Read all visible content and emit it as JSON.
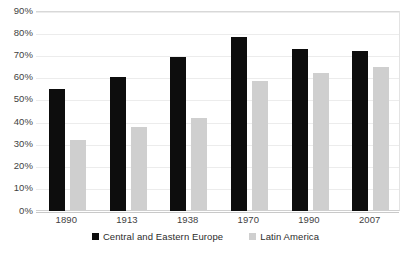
{
  "chart_data": {
    "type": "bar",
    "title": "",
    "subtitle": "",
    "xlabel": "",
    "ylabel": "",
    "categories": [
      "1890",
      "1913",
      "1938",
      "1970",
      "1990",
      "2007"
    ],
    "series": [
      {
        "name": "Central and Eastern Europe",
        "color": "#0d0d0d",
        "values": [
          55,
          60.5,
          69.5,
          78.5,
          73,
          72
        ]
      },
      {
        "name": "Latin America",
        "color": "#cfcfcf",
        "values": [
          32,
          38,
          42,
          58.5,
          62,
          65
        ]
      }
    ],
    "ylim": [
      0,
      90
    ],
    "ytick_values": [
      0,
      10,
      20,
      30,
      40,
      50,
      60,
      70,
      80,
      90
    ],
    "ytick_labels": [
      "0%",
      "10%",
      "20%",
      "30%",
      "40%",
      "50%",
      "60%",
      "70%",
      "80%",
      "90%"
    ],
    "value_unit": "%",
    "grid": true,
    "grid_axis": "y",
    "legend_position": "bottom",
    "legend": [
      "Central and Eastern Europe",
      "Latin America"
    ]
  },
  "colors": {
    "series_cee": "#0d0d0d",
    "series_la": "#cfcfcf",
    "gridline": "#ececec",
    "axis": "#c9c9c9",
    "plot_border": "#e3e3e3",
    "tick_text": "#3f3f3f",
    "legend_text": "#2c2c2c",
    "background": "#ffffff"
  }
}
